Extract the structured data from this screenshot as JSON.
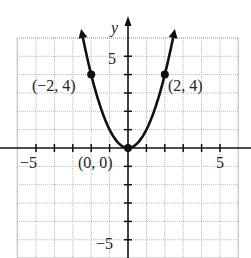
{
  "chart_data": {
    "type": "line",
    "title": "",
    "function": "y = x^2",
    "xlabel": "",
    "ylabel": "y",
    "xlim": [
      -6,
      6
    ],
    "ylim": [
      -6,
      6
    ],
    "grid": true,
    "x_ticks": [
      -5,
      -4,
      -3,
      -2,
      -1,
      1,
      2,
      3,
      4,
      5
    ],
    "y_ticks": [
      -5,
      -4,
      -3,
      -2,
      -1,
      1,
      2,
      3,
      4,
      5
    ],
    "x_tick_labels": [
      {
        "value": -5,
        "label": "−5"
      },
      {
        "value": 5,
        "label": "5"
      }
    ],
    "y_tick_labels": [
      {
        "value": 5,
        "label": "5"
      },
      {
        "value": -5,
        "label": "−5"
      }
    ],
    "series": [
      {
        "name": "parabola",
        "x": [
          -2.6,
          -2,
          -1,
          0,
          1,
          2,
          2.6
        ],
        "y": [
          6.76,
          4,
          1,
          0,
          1,
          4,
          6.76
        ],
        "arrows_at_ends": true
      }
    ],
    "points": [
      {
        "x": -2,
        "y": 4,
        "label": "(−2, 4)"
      },
      {
        "x": 0,
        "y": 0,
        "label": "(0, 0)"
      },
      {
        "x": 2,
        "y": 4,
        "label": "(2, 4)"
      }
    ]
  },
  "axis_labels": {
    "y": "y",
    "x_neg5": "−5",
    "x_pos5": "5",
    "y_pos5": "5",
    "y_neg5": "−5"
  },
  "point_labels": {
    "left": "(−2, 4)",
    "origin": "(0, 0)",
    "right": "(2, 4)"
  }
}
